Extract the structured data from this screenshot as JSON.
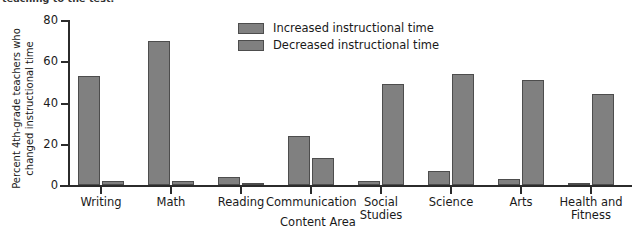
{
  "top_caption": "teaching to the test.",
  "chart_data": {
    "type": "bar",
    "title": "",
    "xlabel": "Content Area",
    "ylabel": "Percent 4th-grade teachers who changed instructional time",
    "ylim": [
      0,
      80
    ],
    "yticks": [
      0,
      20,
      40,
      60,
      80
    ],
    "grid": false,
    "legend_position": "top-center",
    "categories": [
      "Writing",
      "Math",
      "Reading",
      "Communication",
      "Social\nStudies",
      "Science",
      "Arts",
      "Health and\nFitness"
    ],
    "series": [
      {
        "name": "Increased instructional time",
        "color": "#808080",
        "values": [
          53,
          70,
          4,
          24,
          2,
          7,
          3,
          1
        ]
      },
      {
        "name": "Decreased instructional time",
        "color": "#808080",
        "values": [
          2,
          2,
          1,
          13,
          49,
          54,
          51,
          44
        ]
      }
    ]
  }
}
